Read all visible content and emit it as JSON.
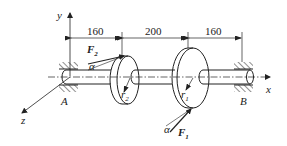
{
  "diagram": {
    "type": "shaft-with-two-pulleys",
    "axes": {
      "x": "x",
      "y": "y",
      "z": "z"
    },
    "dimensions": [
      "160",
      "200",
      "160"
    ],
    "bearings": {
      "left": "A",
      "right": "B"
    },
    "forces": {
      "F2": {
        "symbol": "F",
        "subscript": "2",
        "angle_label": "α"
      },
      "F1": {
        "symbol": "F",
        "subscript": "1",
        "angle_label": "α"
      }
    },
    "radii": {
      "r2": {
        "symbol": "r",
        "subscript": "2"
      },
      "r1": {
        "symbol": "r",
        "subscript": "1"
      }
    },
    "colors": {
      "line": "#222222",
      "background": "#ffffff"
    }
  }
}
